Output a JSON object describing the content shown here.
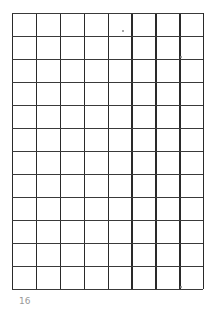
{
  "grid": {
    "columns": 8,
    "rows": 12,
    "left": 12,
    "top": 13,
    "width": 191,
    "height": 276,
    "line_color": "#2a2a2a",
    "background": "#ffffff"
  },
  "footer": {
    "label": "16"
  }
}
